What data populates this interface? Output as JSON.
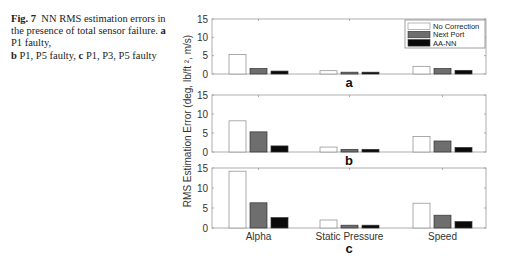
{
  "caption": {
    "fig_label": "Fig. 7",
    "text_1": "NN RMS estimation errors in the presence of total sensor failure.",
    "panel_a_label": "a",
    "panel_a_text": "P1 faulty,",
    "panel_b_label": "b",
    "panel_b_text": "P1, P5 faulty,",
    "panel_c_label": "c",
    "panel_c_text": "P1, P3, P5 faulty"
  },
  "colors": {
    "no_correction": "#ffffff",
    "next_port": "#6e6e6e",
    "aa_nn": "#0a0a0a",
    "axis": "#999999"
  },
  "chart_data": {
    "type": "bar",
    "title": "NN RMS estimation errors in the presence of total sensor failure",
    "ylabel": "RMS Estimation Error  (deg, lb/ft ², m/s)",
    "categories": [
      "Alpha",
      "Static Pressure",
      "Speed"
    ],
    "legend": [
      "No Correction",
      "Next Port",
      "AA-NN"
    ],
    "legend_position": "upper right (panel a)",
    "ylim": [
      0,
      15
    ],
    "yticks": [
      0,
      5,
      10,
      15
    ],
    "grid": false,
    "panels": [
      {
        "label": "a",
        "series": [
          {
            "name": "No Correction",
            "values": [
              5.3,
              0.9,
              2.1
            ]
          },
          {
            "name": "Next Port",
            "values": [
              1.5,
              0.5,
              1.5
            ]
          },
          {
            "name": "AA-NN",
            "values": [
              0.8,
              0.5,
              1.0
            ]
          }
        ]
      },
      {
        "label": "b",
        "series": [
          {
            "name": "No Correction",
            "values": [
              8.2,
              1.3,
              4.1
            ]
          },
          {
            "name": "Next Port",
            "values": [
              5.3,
              0.7,
              2.9
            ]
          },
          {
            "name": "AA-NN",
            "values": [
              1.6,
              0.7,
              1.2
            ]
          }
        ]
      },
      {
        "label": "c",
        "series": [
          {
            "name": "No Correction",
            "values": [
              14.2,
              2.0,
              6.2
            ]
          },
          {
            "name": "Next Port",
            "values": [
              6.3,
              0.7,
              3.2
            ]
          },
          {
            "name": "AA-NN",
            "values": [
              2.6,
              0.7,
              1.6
            ]
          }
        ]
      }
    ]
  }
}
